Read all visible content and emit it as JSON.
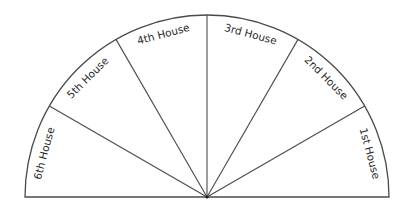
{
  "diagram": {
    "title": "",
    "type": "semicircle-divided",
    "sector_count": 6,
    "sectors": [
      {
        "id": "house-1",
        "label": "1st House"
      },
      {
        "id": "house-2",
        "label": "2nd House"
      },
      {
        "id": "house-3",
        "label": "3rd House"
      },
      {
        "id": "house-4",
        "label": "4th House"
      },
      {
        "id": "house-5",
        "label": "5th House"
      },
      {
        "id": "house-6",
        "label": "6th House"
      }
    ],
    "colors": {
      "line": "#4a4a4a",
      "text": "#2a2a2a",
      "fill": "#ffffff"
    }
  }
}
